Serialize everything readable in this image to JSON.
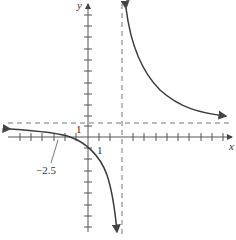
{
  "diagram": {
    "type": "rational-function-graph",
    "axes": {
      "x_label": "x",
      "y_label": "y"
    },
    "tick_labels": {
      "x_unit": "1",
      "y_unit": "1"
    },
    "annotations": {
      "x_intercept_label": "−2.5"
    },
    "asymptotes": {
      "vertical_x": 3,
      "horizontal_y": 1
    },
    "x_intercept": -2.5,
    "colors": {
      "curve": "#3a3a3a",
      "axis": "#555555",
      "asymptote": "#777777"
    }
  }
}
